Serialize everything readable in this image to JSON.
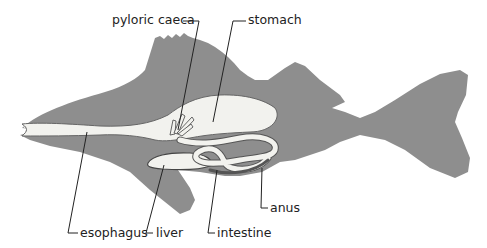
{
  "diagram": {
    "colors": {
      "body": "#8e8e8e",
      "organs": "#f2f2ee",
      "organ_outline": "#555555",
      "leader_lines": "#222222",
      "text": "#222222",
      "background": "#ffffff"
    },
    "labels": {
      "pyloric_caeca": "pyloric caeca",
      "stomach": "stomach",
      "esophagus": "esophagus",
      "liver": "liver",
      "intestine": "intestine",
      "anus": "anus"
    }
  }
}
